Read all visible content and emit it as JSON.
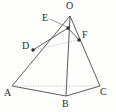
{
  "figure": {
    "kind": "geometry-diagram",
    "background_color": "#fdfdfc",
    "stroke_color": "#4a4a4a",
    "label_color": "#2b2b2b",
    "dot_color": "#2b2b2b",
    "vertices": [
      {
        "id": "O",
        "label": "O",
        "x": 70,
        "y": 16,
        "label_x": 66,
        "label_y": 1,
        "dot": false
      },
      {
        "id": "A",
        "label": "A",
        "x": 12,
        "y": 86,
        "label_x": 4,
        "label_y": 88,
        "dot": false
      },
      {
        "id": "B",
        "label": "B",
        "x": 66,
        "y": 96,
        "label_x": 62,
        "label_y": 99,
        "dot": false
      },
      {
        "id": "C",
        "label": "C",
        "x": 100,
        "y": 86,
        "label_x": 100,
        "label_y": 87,
        "dot": false
      },
      {
        "id": "D",
        "label": "D",
        "x": 33,
        "y": 50,
        "label_x": 22,
        "label_y": 41,
        "dot": true
      },
      {
        "id": "E",
        "label": "E",
        "x": 68,
        "y": 28,
        "label_x": 42,
        "label_y": 13,
        "dot": true
      },
      {
        "id": "F",
        "label": "F",
        "x": 79,
        "y": 40,
        "label_x": 82,
        "label_y": 30,
        "dot": true
      }
    ],
    "edges": [
      {
        "id": "OA",
        "from": "O",
        "to": "A",
        "style": "solid"
      },
      {
        "id": "OB",
        "from": "O",
        "to": "B",
        "style": "solid"
      },
      {
        "id": "OC",
        "from": "O",
        "to": "C",
        "style": "solid"
      },
      {
        "id": "AB",
        "from": "A",
        "to": "B",
        "style": "solid"
      },
      {
        "id": "BC",
        "from": "B",
        "to": "C",
        "style": "solid"
      },
      {
        "id": "AC",
        "from": "A",
        "to": "C",
        "style": "dotted"
      },
      {
        "id": "DF",
        "from": "D",
        "to": "F",
        "style": "dotted"
      },
      {
        "id": "DE",
        "from": "D",
        "to": "E",
        "style": "solid"
      },
      {
        "id": "EF",
        "from": "E",
        "to": "F",
        "style": "solid"
      }
    ],
    "leaders": [
      {
        "id": "E-leader",
        "from_x": 50,
        "from_y": 19,
        "to_x": 67,
        "to_y": 27
      }
    ]
  }
}
